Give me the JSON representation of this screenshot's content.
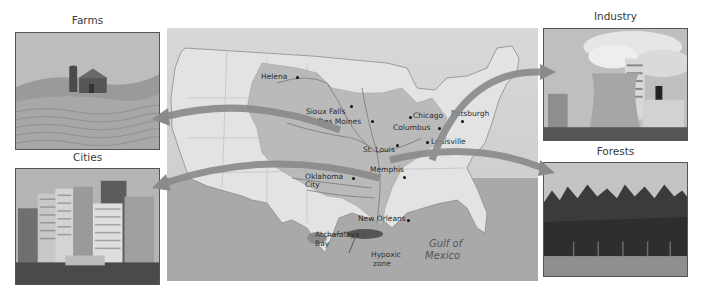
{
  "figure": {
    "panels": [
      {
        "id": "farms",
        "caption": "Farms",
        "position": "top-left"
      },
      {
        "id": "cities",
        "caption": "Cities",
        "position": "bottom-left"
      },
      {
        "id": "industry",
        "caption": "Industry",
        "position": "top-right"
      },
      {
        "id": "forests",
        "caption": "Forests",
        "position": "bottom-right"
      }
    ],
    "map": {
      "subject": "Mississippi River watershed, United States",
      "cities": [
        {
          "name": "Helena"
        },
        {
          "name": "Sioux Falls"
        },
        {
          "name": "Des Moines"
        },
        {
          "name": "Chicago"
        },
        {
          "name": "Pittsburgh"
        },
        {
          "name": "Columbus"
        },
        {
          "name": "Louisville"
        },
        {
          "name": "St. Louis"
        },
        {
          "name": "Memphis"
        },
        {
          "name": "Oklahoma City"
        },
        {
          "name": "New Orleans"
        }
      ],
      "labels": {
        "atchafalaya_line1": "Atchafalaya",
        "atchafalaya_line2": "Bay",
        "hypoxic_line1": "Hypoxic",
        "hypoxic_line2": "zone",
        "gulf_line1": "Gulf of",
        "gulf_line2": "Mexico"
      }
    },
    "arrows": [
      {
        "from": "map",
        "to": "Farms"
      },
      {
        "from": "map",
        "to": "Cities"
      },
      {
        "from": "map",
        "to": "Industry"
      },
      {
        "from": "map",
        "to": "Forests"
      }
    ],
    "colors": {
      "land_outside": "#e4e4e4",
      "watershed": "#b9b9b9",
      "water": "#9e9e9e",
      "arrow": "#8a8a8a",
      "hypoxic": "#555555"
    }
  }
}
